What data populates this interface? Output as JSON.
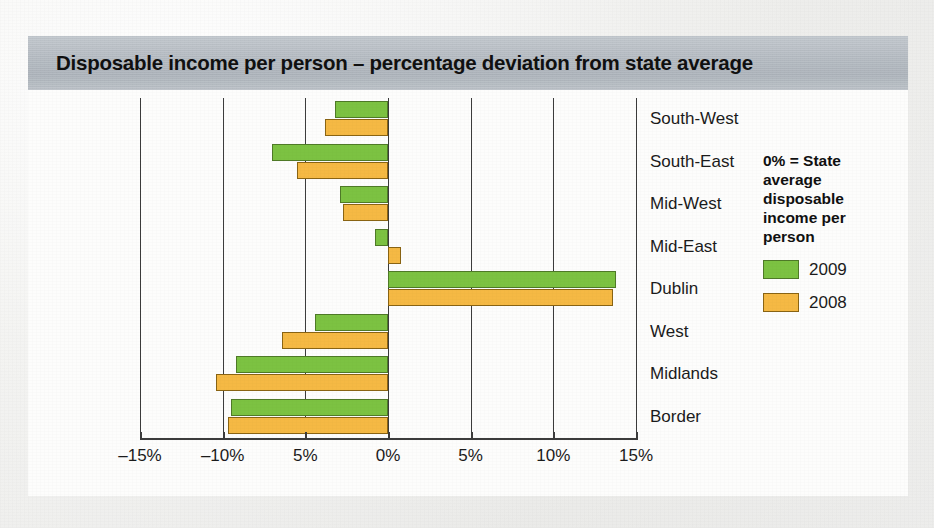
{
  "figure": {
    "title": "Disposable income per person – percentage deviation from state average"
  },
  "legend": {
    "note": "0% = State average disposable income per person",
    "entries": [
      {
        "label": "2009",
        "color": "#7cc242",
        "key": "y2009"
      },
      {
        "label": "2008",
        "color": "#f5b944",
        "key": "y2008"
      }
    ]
  },
  "chart_data": {
    "type": "bar",
    "orientation": "horizontal",
    "title": "Disposable income per person – percentage deviation from state average",
    "xlabel": "",
    "ylabel": "",
    "xlim": [
      -15,
      15
    ],
    "xticks": [
      -15,
      -10,
      -5,
      0,
      5,
      10,
      15
    ],
    "xtick_labels": [
      "–15%",
      "–10%",
      "5%",
      "0%",
      "5%",
      "10%",
      "15%"
    ],
    "grid": true,
    "legend_position": "right",
    "categories": [
      "South-West",
      "South-East",
      "Mid-West",
      "Mid-East",
      "Dublin",
      "West",
      "Midlands",
      "Border"
    ],
    "series": [
      {
        "name": "2009",
        "color": "#7cc242",
        "values": [
          -3.2,
          -7.0,
          -2.9,
          -0.8,
          13.8,
          -4.4,
          -9.2,
          -9.5
        ]
      },
      {
        "name": "2008",
        "color": "#f5b944",
        "values": [
          -3.8,
          -5.5,
          -2.7,
          0.8,
          13.6,
          -6.4,
          -10.4,
          -9.7
        ]
      }
    ]
  }
}
